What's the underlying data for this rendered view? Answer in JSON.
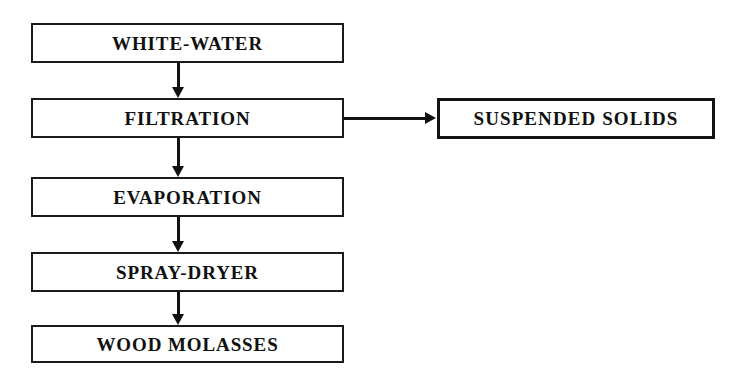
{
  "diagram": {
    "background_color": "#ffffff",
    "line_color": "#111111",
    "text_color": "#111111",
    "nodes": [
      {
        "id": "white-water",
        "label": "WHITE-WATER"
      },
      {
        "id": "filtration",
        "label": "FILTRATION"
      },
      {
        "id": "evaporation",
        "label": "EVAPORATION"
      },
      {
        "id": "spray-dryer",
        "label": "SPRAY-DRYER"
      },
      {
        "id": "wood-molasses",
        "label": "WOOD MOLASSES"
      },
      {
        "id": "suspended-solids",
        "label": "SUSPENDED SOLIDS"
      }
    ],
    "edges": [
      {
        "from": "WHITE-WATER",
        "to": "FILTRATION",
        "direction": "down"
      },
      {
        "from": "FILTRATION",
        "to": "EVAPORATION",
        "direction": "down"
      },
      {
        "from": "EVAPORATION",
        "to": "SPRAY-DRYER",
        "direction": "down"
      },
      {
        "from": "SPRAY-DRYER",
        "to": "WOOD MOLASSES",
        "direction": "down"
      },
      {
        "from": "FILTRATION",
        "to": "SUSPENDED SOLIDS",
        "direction": "right"
      }
    ]
  }
}
